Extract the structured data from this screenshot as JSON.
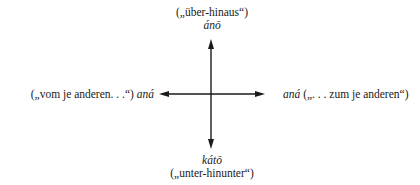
{
  "diagram": {
    "type": "cross-arrow-diagram",
    "top": {
      "gloss": "(„über-hinaus“)",
      "term": "ánō"
    },
    "bottom": {
      "term": "kátō",
      "gloss": "(„unter-hinunter“)"
    },
    "left": {
      "gloss": "(„vom je anderen. . .“)",
      "term": "aná"
    },
    "right": {
      "term": "aná",
      "gloss": "(„. . . zum je anderen“)"
    },
    "arrows": {
      "vertical": {
        "x": 211,
        "y1": 40,
        "y2": 148,
        "double_headed": true
      },
      "horizontal": {
        "y": 94,
        "x1": 160,
        "x2": 264,
        "double_headed": true
      }
    },
    "colors": {
      "line": "#1a1a1a",
      "background": "#ffffff"
    }
  }
}
